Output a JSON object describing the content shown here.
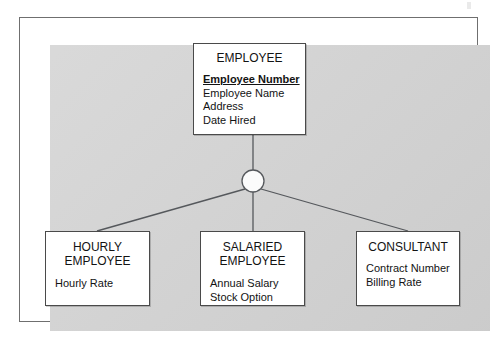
{
  "diagram": {
    "type": "entity-relationship-supertype-subtype",
    "colors": {
      "page_background": "#ffffff",
      "panel_background": "#d2d2d2",
      "entity_fill": "#ffffff",
      "entity_border": "#4a4a4a",
      "connector_line": "#55585c",
      "text": "#131313"
    },
    "supertype": {
      "title": "EMPLOYEE",
      "attributes": [
        {
          "label": "Employee Number",
          "is_primary_key": true
        },
        {
          "label": "Employee Name",
          "is_primary_key": false
        },
        {
          "label": "Address",
          "is_primary_key": false
        },
        {
          "label": "Date Hired",
          "is_primary_key": false
        }
      ]
    },
    "connector": {
      "shape": "circle",
      "filled": false,
      "center_x": 253,
      "center_y": 181,
      "radius": 11
    },
    "subtypes": [
      {
        "title": "HOURLY\nEMPLOYEE",
        "attributes": [
          {
            "label": "Hourly Rate",
            "is_primary_key": false
          }
        ]
      },
      {
        "title": "SALARIED\nEMPLOYEE",
        "attributes": [
          {
            "label": "Annual Salary",
            "is_primary_key": false
          },
          {
            "label": "Stock Option",
            "is_primary_key": false
          }
        ]
      },
      {
        "title": "CONSULTANT",
        "attributes": [
          {
            "label": "Contract Number",
            "is_primary_key": false
          },
          {
            "label": "Billing Rate",
            "is_primary_key": false
          }
        ]
      }
    ]
  }
}
